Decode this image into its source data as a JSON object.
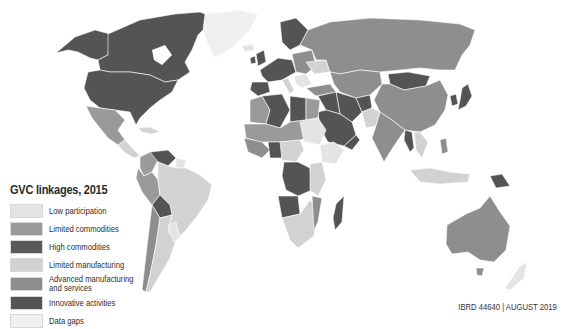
{
  "map": {
    "title": "GVC linkages, 2015",
    "credit": "IBRD 44640 | AUGUST 2019",
    "colors": {
      "low_participation": "#e4e4e4",
      "limited_commodities": "#9a9a9a",
      "high_commodities": "#5a5a5a",
      "limited_manufacturing": "#d2d2d2",
      "advanced_manufacturing": "#8e8e8e",
      "innovative_activities": "#545454",
      "data_gaps": "#f0f0f0",
      "border": "#ffffff",
      "ocean": "#ffffff"
    },
    "legend": [
      {
        "key": "low_participation",
        "label": "Low participation",
        "color": "#e4e4e4"
      },
      {
        "key": "limited_commodities",
        "label": "Limited commodities",
        "color": "#9a9a9a"
      },
      {
        "key": "high_commodities",
        "label": "High commodities",
        "color": "#5a5a5a"
      },
      {
        "key": "limited_manufacturing",
        "label": "Limited manufacturing",
        "color": "#d2d2d2"
      },
      {
        "key": "advanced_manufacturing",
        "label_line1": "Advanced manufacturing",
        "label_line2": "and services",
        "color": "#8e8e8e"
      },
      {
        "key": "innovative_activities",
        "label": "Innovative activities",
        "color": "#545454"
      },
      {
        "key": "data_gaps",
        "label": "Data gaps",
        "color": "#f0f0f0"
      }
    ]
  }
}
